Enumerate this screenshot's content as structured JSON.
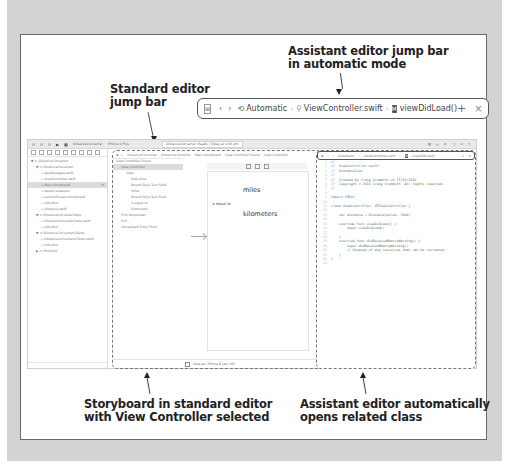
{
  "callouts": {
    "assistant_jump_bar": [
      "Assistant editor jump bar",
      "in automatic mode"
    ],
    "standard_jump_bar": [
      "Standard editor",
      "jump bar"
    ],
    "storyboard": [
      "Storyboard in standard editor",
      "with View Controller selected"
    ],
    "assistant_opens": [
      "Assistant editor automatically",
      "opens related class"
    ]
  },
  "assistant_jump_bar_enlarged": {
    "mode": "Automatic",
    "file": "ViewController.swift",
    "symbol": "viewDidLoad()",
    "add": "+",
    "close": "×"
  },
  "toolbar": {
    "scheme": "DistanceConverter",
    "device": "iPhone 6 Plus",
    "status": "DistanceConverter: Ready",
    "time": "Today at 4:05 pm"
  },
  "navigator": {
    "items": [
      {
        "label": "DistanceConverter",
        "indent": 0,
        "arrow": "▼"
      },
      {
        "label": "DistanceConverter",
        "indent": 1,
        "arrow": "▼"
      },
      {
        "label": "AppDelegate.swift",
        "indent": 2,
        "arrow": ""
      },
      {
        "label": "ViewController.swift",
        "indent": 2,
        "arrow": ""
      },
      {
        "label": "Main.storyboard",
        "indent": 2,
        "arrow": "",
        "selected": true,
        "badge": "M"
      },
      {
        "label": "Assets.xcassets",
        "indent": 2,
        "arrow": ""
      },
      {
        "label": "LaunchScreen.storyboard",
        "indent": 2,
        "arrow": ""
      },
      {
        "label": "Info.plist",
        "indent": 2,
        "arrow": ""
      },
      {
        "label": "Distance.swift",
        "indent": 2,
        "arrow": ""
      },
      {
        "label": "DistanceConverterTests",
        "indent": 1,
        "arrow": "▼"
      },
      {
        "label": "DistanceConverterTests.swift",
        "indent": 2,
        "arrow": ""
      },
      {
        "label": "Info.plist",
        "indent": 2,
        "arrow": ""
      },
      {
        "label": "DistanceConverterUITests",
        "indent": 1,
        "arrow": "▼"
      },
      {
        "label": "DistanceConverterUITests.swift",
        "indent": 2,
        "arrow": ""
      },
      {
        "label": "Info.plist",
        "indent": 2,
        "arrow": ""
      },
      {
        "label": "Products",
        "indent": 1,
        "arrow": "▶"
      }
    ]
  },
  "standard_jump_bar": {
    "crumbs": [
      "DistanceConverter",
      "DistanceConverter",
      "Main.storyboard",
      "View Controller Scene",
      "View Controller"
    ]
  },
  "outline": {
    "items": [
      {
        "label": "View Controller Scene",
        "indent": 0
      },
      {
        "label": "View Controller",
        "indent": 1,
        "selected": true
      },
      {
        "label": "View",
        "indent": 2
      },
      {
        "label": "Safe Area",
        "indent": 3
      },
      {
        "label": "Round Style Text Field",
        "indent": 3
      },
      {
        "label": "miles",
        "indent": 3
      },
      {
        "label": "Round Style Text Field",
        "indent": 3
      },
      {
        "label": "is equal to",
        "indent": 3
      },
      {
        "label": "kilometers",
        "indent": 3
      },
      {
        "label": "First Responder",
        "indent": 1
      },
      {
        "label": "Exit",
        "indent": 1
      },
      {
        "label": "Storyboard Entry Point",
        "indent": 1
      }
    ]
  },
  "scene": {
    "miles": "miles",
    "equal": "is equal to",
    "kilometers": "kilometers",
    "view_as": "View as: iPhone 8 (wC hR)"
  },
  "assistant_jump_bar": {
    "mode": "Automatic",
    "file": "ViewController.swift",
    "symbol": "viewDidLoad()"
  },
  "code": [
    "//",
    "//  ViewController.swift",
    "//  DistanceConv",
    "//",
    "//  Created by Craig Grummitt on 17/01/2016.",
    "//  Copyright © 2016 Craig Grummitt. All rights reserved.",
    "//",
    "",
    "import UIKit",
    "",
    "class ViewController: UIViewController {",
    "",
    "    var distance = Distance(miles: 1000)",
    "",
    "    override func viewDidLoad() {",
    "        super.viewDidLoad()",
    "",
    "    }",
    "    override func didReceiveMemoryWarning() {",
    "        super.didReceiveMemoryWarning()",
    "        // Dispose of any resources that can be recreated.",
    "    }",
    "}",
    ""
  ]
}
